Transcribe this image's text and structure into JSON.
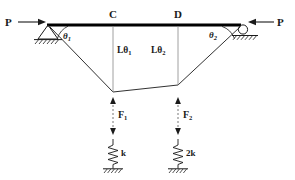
{
  "diagram": {
    "stroke_color": "#1a1a1a",
    "bar_color": "#000000",
    "dash_color": "#555555",
    "loads": {
      "left_label": "P",
      "right_label": "P",
      "left_arrow_icon": "arrow-right-icon",
      "right_arrow_icon": "arrow-left-icon"
    },
    "supports": {
      "left": {
        "type": "pin-support",
        "angle_label": "θ",
        "angle_sub": "1",
        "hatch_icon": "ground-hatch-icon"
      },
      "right": {
        "type": "roller-support",
        "angle_label": "θ",
        "angle_sub": "2",
        "hatch_icon": "ground-hatch-icon"
      }
    },
    "nodes": [
      {
        "name": "C",
        "label": "C"
      },
      {
        "name": "D",
        "label": "D"
      }
    ],
    "dimensions": [
      {
        "name": "L-theta-1",
        "label": "Lθ",
        "sub": "1"
      },
      {
        "name": "L-theta-2",
        "label": "Lθ",
        "sub": "2"
      }
    ],
    "forces": [
      {
        "name": "F1",
        "label": "F",
        "sub": "1",
        "icon": "double-arrow-vertical-icon"
      },
      {
        "name": "F2",
        "label": "F",
        "sub": "2",
        "icon": "double-arrow-vertical-icon"
      }
    ],
    "springs": [
      {
        "name": "spring-k",
        "label": "k",
        "icon": "spring-icon"
      },
      {
        "name": "spring-2k",
        "label": "2k",
        "icon": "spring-icon"
      }
    ]
  }
}
